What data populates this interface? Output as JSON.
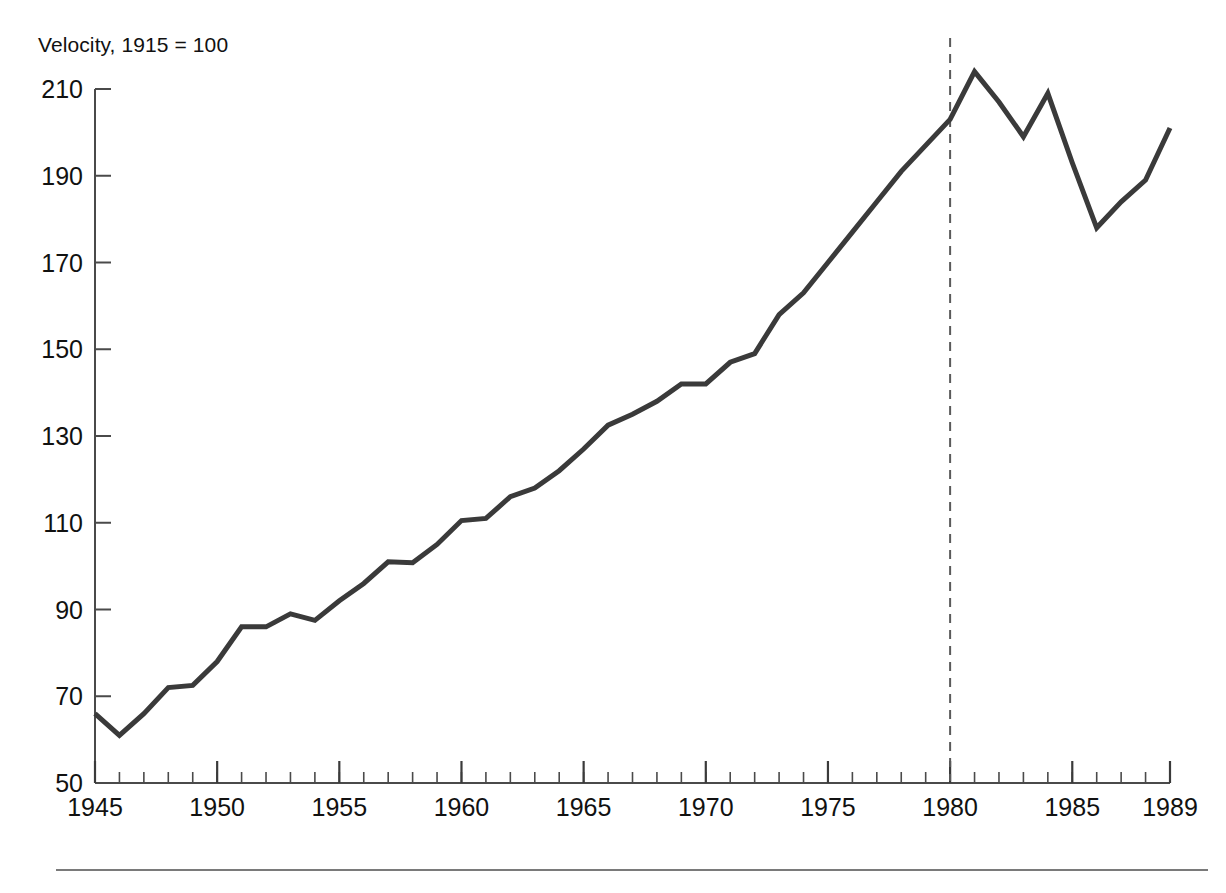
{
  "chart_data": {
    "type": "line",
    "title": "",
    "axis_note": "Velocity, 1915 = 100",
    "xlabel": "",
    "ylabel": "Velocity, 1915 = 100",
    "xlim": [
      1945,
      1989
    ],
    "ylim": [
      50,
      210
    ],
    "ytick_labels": [
      "50",
      "70",
      "90",
      "110",
      "130",
      "150",
      "170",
      "190",
      "210"
    ],
    "yticks": [
      50,
      70,
      90,
      110,
      130,
      150,
      170,
      190,
      210
    ],
    "xtick_labels": [
      "1945",
      "1950",
      "1955",
      "1960",
      "1965",
      "1970",
      "1975",
      "1980",
      "1985",
      "1989"
    ],
    "xticks": [
      1945,
      1950,
      1955,
      1960,
      1965,
      1970,
      1975,
      1980,
      1985,
      1989
    ],
    "minor_xtick_interval": 1,
    "grid": false,
    "legend": null,
    "line_color": "#3a3a3a",
    "line_width": 5,
    "annotations": [
      {
        "name": "vertical-reference-line-1980",
        "type": "vline",
        "x": 1980,
        "style": "dashed",
        "color": "#5a5a5a"
      }
    ],
    "x": [
      1945,
      1946,
      1947,
      1948,
      1949,
      1950,
      1951,
      1952,
      1953,
      1954,
      1955,
      1956,
      1957,
      1958,
      1959,
      1960,
      1961,
      1962,
      1963,
      1964,
      1965,
      1966,
      1967,
      1968,
      1969,
      1970,
      1971,
      1972,
      1973,
      1974,
      1975,
      1976,
      1977,
      1978,
      1979,
      1980,
      1981,
      1982,
      1983,
      1984,
      1985,
      1986,
      1987,
      1988,
      1989
    ],
    "values": [
      66,
      61,
      66,
      72,
      72.5,
      78,
      86,
      86,
      89,
      87.5,
      92,
      96,
      101,
      100.8,
      105,
      110.5,
      111,
      116,
      118,
      122,
      127,
      132.5,
      135,
      138,
      142,
      142,
      147,
      149,
      158,
      163,
      170,
      177,
      184,
      191,
      197,
      203,
      214,
      207,
      199,
      209,
      193,
      178,
      184,
      189,
      201
    ],
    "series": [
      {
        "name": "Velocity",
        "values": [
          66,
          61,
          66,
          72,
          72.5,
          78,
          86,
          86,
          89,
          87.5,
          92,
          96,
          101,
          100.8,
          105,
          110.5,
          111,
          116,
          118,
          122,
          127,
          132.5,
          135,
          138,
          142,
          142,
          147,
          149,
          158,
          163,
          170,
          177,
          184,
          191,
          197,
          203,
          214,
          207,
          199,
          209,
          193,
          178,
          184,
          189,
          201
        ]
      }
    ]
  },
  "caption": {
    "text": ""
  }
}
